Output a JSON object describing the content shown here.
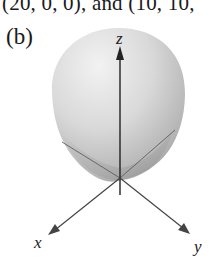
{
  "top_text": "(20, 0, 0), and (10, 10,",
  "panel_label": "(b)",
  "figure": {
    "axes": {
      "z_label": "z",
      "x_label": "x",
      "y_label": "y"
    },
    "colors": {
      "surface_light": "#e8e8e8",
      "surface_dark": "#9a9a9a",
      "axis": "#333333"
    }
  }
}
